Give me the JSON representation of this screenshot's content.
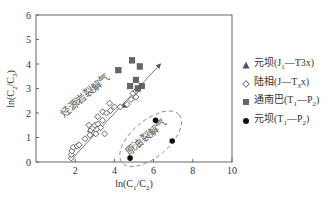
{
  "chart_data": {
    "type": "scatter",
    "title": "",
    "xlabel": "ln(C1/C2)",
    "ylabel": "ln(C2/C3)",
    "xlim": [
      0,
      10
    ],
    "ylim": [
      0,
      6
    ],
    "xticks": [
      "2",
      "4",
      "6",
      "8",
      "10"
    ],
    "yticks": [
      "0",
      "1",
      "2",
      "3",
      "4",
      "5",
      "6"
    ],
    "grid": false,
    "legend_position": "right",
    "annotations": [
      {
        "text": "烃源岩裂解气",
        "x": 2.6,
        "y": 2.6,
        "rotation": -40
      },
      {
        "text": "原油裂解气",
        "x": 5.7,
        "y": 0.9,
        "rotation": -40
      }
    ],
    "trend_arrow": {
      "from": [
        1.8,
        0.1
      ],
      "to": [
        6.35,
        4.0
      ]
    },
    "region_ellipse": {
      "cx": 5.85,
      "cy": 0.95,
      "rx": 1.9,
      "ry": 0.75,
      "rotation": -40,
      "style": "dashed"
    },
    "series": [
      {
        "name": "元坝(J1—T3x)",
        "marker": "triangle",
        "color": "#555555",
        "points": [
          [
            2.75,
            1.3
          ],
          [
            2.8,
            1.4
          ],
          [
            2.85,
            1.35
          ],
          [
            4.5,
            2.3
          ]
        ]
      },
      {
        "name": "陆相(J—T3x)",
        "marker": "diamond-open",
        "color": "#555555",
        "points": [
          [
            1.8,
            0.16
          ],
          [
            1.8,
            0.3
          ],
          [
            1.83,
            0.45
          ],
          [
            1.9,
            0.6
          ],
          [
            2.1,
            0.65
          ],
          [
            2.2,
            0.7
          ],
          [
            2.5,
            0.95
          ],
          [
            2.75,
            1.1
          ],
          [
            2.8,
            1.3
          ],
          [
            2.9,
            1.4
          ],
          [
            2.7,
            1.5
          ],
          [
            3.0,
            1.5
          ],
          [
            3.15,
            1.55
          ],
          [
            3.3,
            1.4
          ],
          [
            3.05,
            1.15
          ],
          [
            3.5,
            1.15
          ],
          [
            3.4,
            1.7
          ],
          [
            3.15,
            1.85
          ],
          [
            3.4,
            2.05
          ],
          [
            3.6,
            2.0
          ],
          [
            3.8,
            2.1
          ],
          [
            4.0,
            2.25
          ],
          [
            3.75,
            2.4
          ],
          [
            4.3,
            2.25
          ],
          [
            4.65,
            2.35
          ],
          [
            4.85,
            2.55
          ],
          [
            4.95,
            2.8
          ],
          [
            5.1,
            2.9
          ],
          [
            5.1,
            2.65
          ]
        ]
      },
      {
        "name": "通南巴(T1—P2)",
        "marker": "square",
        "color": "#666666",
        "points": [
          [
            4.9,
            4.15
          ],
          [
            5.3,
            3.9
          ],
          [
            4.2,
            3.75
          ],
          [
            5.1,
            3.35
          ],
          [
            4.8,
            3.1
          ],
          [
            5.4,
            3.1
          ],
          [
            5.2,
            3.0
          ]
        ]
      },
      {
        "name": "元坝(T1—P2)",
        "marker": "circle",
        "color": "#111111",
        "points": [
          [
            6.1,
            1.7
          ],
          [
            6.95,
            0.86
          ],
          [
            4.8,
            0.16
          ]
        ]
      }
    ]
  },
  "legend": {
    "items": [
      {
        "label": "元坝(J",
        "sub1": "1",
        "mid": "—T3x)",
        "sub2": ""
      },
      {
        "label": "陆相(J—T",
        "sub1": "3",
        "mid": "x)",
        "sub2": ""
      },
      {
        "label": "通南巴(T",
        "sub1": "1",
        "mid": "—P",
        "sub2": "2",
        "end": ")"
      },
      {
        "label": "元坝(T",
        "sub1": "1",
        "mid": "—P",
        "sub2": "2",
        "end": ")"
      }
    ]
  },
  "axes": {
    "xlabel_main": "ln(C",
    "xlabel_sub1": "1",
    "xlabel_mid": "/C",
    "xlabel_sub2": "2",
    "xlabel_end": ")",
    "ylabel_main": "ln(C",
    "ylabel_sub1": "2",
    "ylabel_mid": "/C",
    "ylabel_sub2": "3",
    "ylabel_end": ")"
  }
}
